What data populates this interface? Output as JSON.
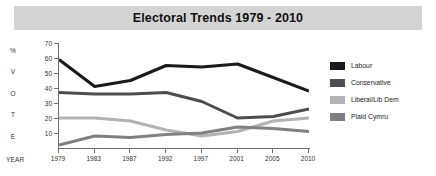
{
  "title": "Electoral Trends 1979 - 2010",
  "axis": {
    "vertical_label_chars": [
      "%",
      "V",
      "O",
      "T",
      "E"
    ],
    "year_label": "YEAR"
  },
  "legend": {
    "items": [
      {
        "label": "Labour",
        "color": "#1a1a1a"
      },
      {
        "label": "Conservative",
        "color": "#4d4d4d"
      },
      {
        "label": "Liberal/Lib Dem",
        "color": "#b3b3b3"
      },
      {
        "label": "Plaid Cymru",
        "color": "#808080"
      }
    ]
  },
  "chart_data": {
    "type": "line",
    "title": "Electoral Trends 1979 - 2010",
    "xlabel": "YEAR",
    "ylabel": "% VOTE",
    "categories": [
      "1979",
      "1983",
      "1987",
      "1992",
      "1997",
      "2001",
      "2005",
      "2010"
    ],
    "yticks": [
      10,
      20,
      30,
      40,
      50,
      60,
      70
    ],
    "ylim": [
      0,
      70
    ],
    "grid": false,
    "legend_position": "right",
    "series": [
      {
        "name": "Labour",
        "color": "#1a1a1a",
        "values": [
          59,
          41,
          45,
          55,
          54,
          56,
          47,
          38
        ]
      },
      {
        "name": "Conservative",
        "color": "#4d4d4d",
        "values": [
          37,
          36,
          36,
          37,
          31,
          20,
          21,
          26
        ]
      },
      {
        "name": "Liberal/Lib Dem",
        "color": "#b3b3b3",
        "values": [
          20,
          20,
          18,
          12,
          8,
          11,
          18,
          20
        ]
      },
      {
        "name": "Plaid Cymru",
        "color": "#808080",
        "values": [
          2,
          8,
          7,
          9,
          10,
          14,
          13,
          11
        ]
      }
    ]
  }
}
